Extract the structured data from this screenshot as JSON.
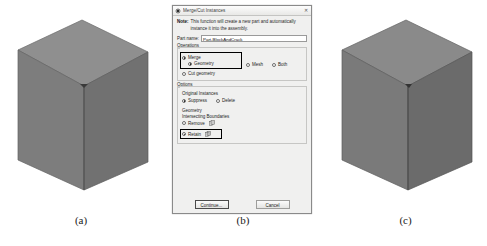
{
  "figure": {
    "panels": [
      {
        "caption": "(a)",
        "name": "cube-intact"
      },
      {
        "caption": "(b)",
        "name": "merge-cut-dialog"
      },
      {
        "caption": "(c)",
        "name": "cube-merged"
      }
    ]
  },
  "dialog": {
    "title": "Merge/Cut Instances",
    "title_icon": "abaqus-merge-icon",
    "close_label": "✕",
    "note_label": "Note:",
    "note_text": "This function will create a new part and automatically instance it into the assembly.",
    "part_name_label": "Part name:",
    "part_name_value": "Part-BlockAndCrack",
    "operations": {
      "group_title": "Operations",
      "merge_label": "Merge",
      "merge_selected": true,
      "geometry_label": "Geometry",
      "geometry_selected": true,
      "mesh_label": "Mesh",
      "mesh_selected": false,
      "both_label": "Both",
      "both_selected": false,
      "cut_geometry_label": "Cut geometry",
      "cut_geometry_selected": false
    },
    "options": {
      "group_title": "Options",
      "original_instances_label": "Original Instances",
      "suppress_label": "Suppress",
      "suppress_selected": true,
      "delete_label": "Delete",
      "delete_selected": false,
      "geometry_label": "Geometry",
      "intersecting_boundaries_label": "Intersecting Boundaries",
      "remove_label": "Remove",
      "remove_selected": false,
      "remove_icon": "boundary-remove-icon",
      "retain_label": "Retain",
      "retain_selected": true,
      "retain_icon": "boundary-retain-icon"
    },
    "buttons": {
      "continue_label": "Continue...",
      "cancel_label": "Cancel"
    }
  },
  "colors": {
    "dialog_bg": "#f0f0ef",
    "highlight_outline": "#000000",
    "cube_top": "#8d8d8d",
    "cube_left": "#7b7b7b",
    "cube_right": "#6f6f6f"
  }
}
